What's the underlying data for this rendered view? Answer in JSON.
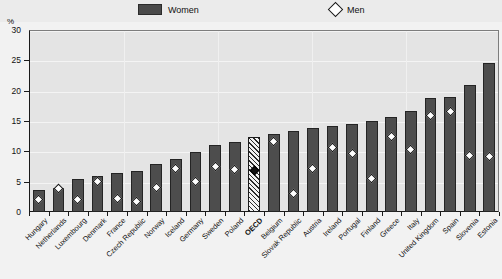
{
  "axis": {
    "y_unit_label": "%",
    "y_ticks": [
      "0",
      "5",
      "10",
      "15",
      "20",
      "25",
      "30"
    ]
  },
  "legend": {
    "women_label": "Women",
    "men_label": "Men",
    "women_swatch": "bar-swatch-icon",
    "men_swatch": "diamond-marker-icon"
  },
  "chart_data": {
    "type": "bar",
    "title": "",
    "subtitle": "",
    "xlabel": "",
    "ylabel": "%",
    "ylim": [
      0,
      30
    ],
    "ytick_values": [
      0,
      5,
      10,
      15,
      20,
      25,
      30
    ],
    "grid": true,
    "legend_position": "top",
    "categories": [
      "Hungary",
      "Netherlands",
      "Luxembourg",
      "Denmark",
      "France",
      "Czech Republic",
      "Norway",
      "Iceland",
      "Germany",
      "Sweden",
      "Poland",
      "OECD",
      "Belgium",
      "Slovak Republic",
      "Austria",
      "Ireland",
      "Portugal",
      "Finland",
      "Greece",
      "Italy",
      "United Kingdom",
      "Spain",
      "Slovenia",
      "Estonia"
    ],
    "series": [
      {
        "name": "Women",
        "type": "bar",
        "values": [
          3.6,
          4.0,
          5.4,
          6.0,
          6.4,
          6.8,
          7.9,
          8.8,
          9.9,
          11.1,
          11.6,
          12.3,
          12.9,
          13.4,
          13.9,
          14.2,
          14.5,
          15.0,
          15.6,
          16.7,
          18.8,
          19.0,
          21.0,
          24.5
        ]
      },
      {
        "name": "Men",
        "type": "scatter",
        "marker": "diamond",
        "values": [
          2.1,
          3.8,
          2.0,
          5.0,
          2.2,
          1.7,
          4.1,
          7.2,
          5.0,
          7.5,
          7.0,
          6.9,
          11.6,
          3.1,
          7.2,
          10.6,
          9.7,
          5.5,
          12.5,
          10.3,
          15.9,
          16.6,
          9.3,
          9.2
        ]
      }
    ],
    "highlight_category": "OECD",
    "highlight_style": "hatched bar with filled black diamond"
  }
}
